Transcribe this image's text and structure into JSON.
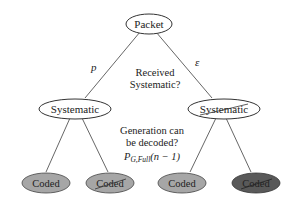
{
  "diagram": {
    "type": "tree",
    "root": {
      "id": "packet",
      "label": "Packet",
      "fill": "#ffffff"
    },
    "level1": [
      {
        "id": "systematic-left",
        "label": "Systematic",
        "struck": false,
        "fill": "#ffffff",
        "edge_label": "p"
      },
      {
        "id": "systematic-right",
        "label": "Systematic",
        "struck": true,
        "fill": "#ffffff",
        "edge_label": "ε"
      }
    ],
    "level2": [
      {
        "id": "coded-1",
        "label": "Coded",
        "struck": false,
        "fill": "#a6a6a6",
        "parent": "systematic-left"
      },
      {
        "id": "coded-2",
        "label": "Coded",
        "struck": true,
        "fill": "#a6a6a6",
        "parent": "systematic-left"
      },
      {
        "id": "coded-3",
        "label": "Coded",
        "struck": false,
        "fill": "#a6a6a6",
        "parent": "systematic-right"
      },
      {
        "id": "coded-4",
        "label": "Coded",
        "struck": true,
        "fill": "#595959",
        "parent": "systematic-right"
      }
    ],
    "questions": {
      "level1_line1": "Received",
      "level1_line2": "Systematic?",
      "level2_line1": "Generation can",
      "level2_line2": "be decoded?",
      "level2_formula_main": "P",
      "level2_formula_sub": "G,Full",
      "level2_formula_arg": "(n − 1)"
    }
  }
}
